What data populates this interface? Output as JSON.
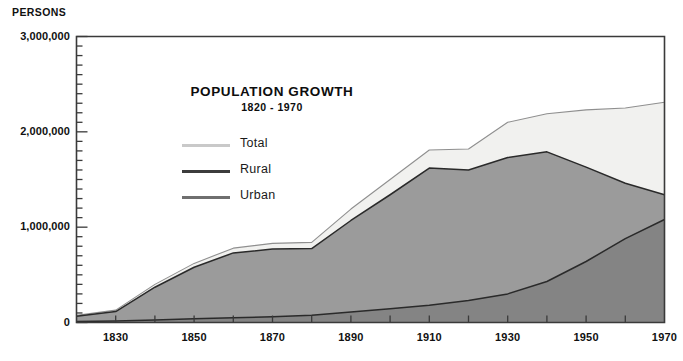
{
  "chart_data": {
    "type": "area",
    "title": "POPULATION GROWTH",
    "subtitle": "1820 - 1970",
    "xlabel": "",
    "ylabel": "PERSONS",
    "ylim": [
      0,
      3000000
    ],
    "xlim": [
      1820,
      1970
    ],
    "grid": false,
    "legend_position": "inside-upper-left",
    "y_tick_labels": [
      "3,000,000",
      "2,000,000",
      "1,000,000",
      "0"
    ],
    "y_tick_values": [
      3000000,
      2000000,
      1000000,
      0
    ],
    "y_minor_tick_interval": 100000,
    "x_tick_labels": [
      "1830",
      "1850",
      "1870",
      "1890",
      "1910",
      "1930",
      "1950",
      "1970"
    ],
    "x_tick_values": [
      1830,
      1850,
      1870,
      1890,
      1910,
      1930,
      1950,
      1970
    ],
    "x_minor_tick_interval": 10,
    "x": [
      1820,
      1830,
      1840,
      1850,
      1860,
      1870,
      1880,
      1890,
      1900,
      1910,
      1920,
      1930,
      1940,
      1950,
      1960,
      1970
    ],
    "series": [
      {
        "name": "Total",
        "color": "#f1f1ef",
        "line_color": "#8f8f8f",
        "values": [
          75000,
          130000,
          400000,
          620000,
          780000,
          830000,
          840000,
          1190000,
          1500000,
          1810000,
          1820000,
          2100000,
          2190000,
          2230000,
          2250000,
          2310000
        ]
      },
      {
        "name": "Rural",
        "color": "#9b9b9b",
        "line_color": "#2a2a2a",
        "values": [
          65000,
          115000,
          370000,
          580000,
          730000,
          770000,
          775000,
          1070000,
          1340000,
          1620000,
          1600000,
          1730000,
          1790000,
          1630000,
          1460000,
          1340000
        ]
      },
      {
        "name": "Urban",
        "color": "#848484",
        "line_color": "#2a2a2a",
        "values": [
          10000,
          15000,
          25000,
          40000,
          50000,
          60000,
          75000,
          110000,
          145000,
          180000,
          230000,
          300000,
          430000,
          640000,
          880000,
          1080000
        ]
      }
    ],
    "colors": {
      "total_fill": "#f1f1ef",
      "rural_fill": "#9b9b9b",
      "urban_fill": "#848484",
      "axis": "#3a3a3a",
      "text": "#111111"
    }
  },
  "legend": {
    "items": [
      {
        "label": "Total",
        "swatch": "#c9c9c9"
      },
      {
        "label": "Rural",
        "swatch": "#3c3c3c"
      },
      {
        "label": "Urban",
        "swatch": "#6f6f6f"
      }
    ]
  }
}
